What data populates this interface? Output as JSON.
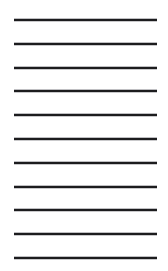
{
  "document": {
    "kind": "ruled-lined-paper",
    "page": {
      "width": 168,
      "height": 271,
      "background_color": "#ffffff"
    },
    "rules": {
      "count": 11,
      "color": "#1c1c1e",
      "thickness": 2,
      "left": 14,
      "right": 157,
      "length": 143,
      "spacing": 23.8,
      "first_y": 19,
      "last_y": 257,
      "y_positions": [
        19,
        42.8,
        66.6,
        90.4,
        114.2,
        138,
        161.8,
        185.6,
        209.4,
        233.2,
        257
      ]
    },
    "margins": {
      "top": 19,
      "bottom": 14,
      "left": 14,
      "right": 11
    },
    "writing_lines": [
      "",
      "",
      "",
      "",
      "",
      "",
      "",
      "",
      "",
      "",
      ""
    ]
  }
}
